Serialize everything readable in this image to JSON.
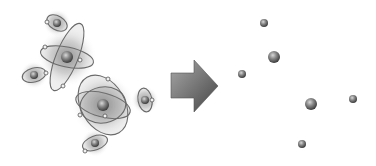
{
  "diagram": {
    "left_panel": {
      "label": "atoms-with-orbits",
      "atoms": [
        {
          "id": "top-small",
          "cx": 57,
          "cy": 23,
          "r": 4,
          "orbits": [
            {
              "rx": 11,
              "ry": 7,
              "rot": 30
            }
          ],
          "electrons": [
            [
              47,
              22
            ]
          ],
          "halo": 14
        },
        {
          "id": "upper-large",
          "cx": 67,
          "cy": 57,
          "r": 6,
          "orbits": [
            {
              "rx": 27,
              "ry": 10,
              "rot": 12
            },
            {
              "rx": 36,
              "ry": 11,
              "rot": -68
            }
          ],
          "electrons": [
            [
              45,
              47
            ],
            [
              80,
              60
            ],
            [
              63,
              86
            ]
          ],
          "halo": 30
        },
        {
          "id": "left-small",
          "cx": 34,
          "cy": 75,
          "r": 4,
          "orbits": [
            {
              "rx": 12,
              "ry": 7,
              "rot": -15
            }
          ],
          "electrons": [
            [
              46,
              73
            ]
          ],
          "halo": 14
        },
        {
          "id": "lower-large",
          "cx": 103,
          "cy": 105,
          "r": 6,
          "orbits": [
            {
              "rx": 28,
              "ry": 12,
              "rot": 15
            },
            {
              "rx": 32,
              "ry": 22,
              "rot": 60
            },
            {
              "rx": 23,
              "ry": 18,
              "rot": -10
            }
          ],
          "electrons": [
            [
              108,
              79
            ],
            [
              80,
              115
            ],
            [
              105,
              116
            ]
          ],
          "halo": 32
        },
        {
          "id": "right-small",
          "cx": 145,
          "cy": 100,
          "r": 4,
          "orbits": [
            {
              "rx": 7,
              "ry": 12,
              "rot": -10
            }
          ],
          "electrons": [
            [
              152,
              100
            ]
          ],
          "halo": 14
        },
        {
          "id": "bottom-small",
          "cx": 95,
          "cy": 143,
          "r": 4,
          "orbits": [
            {
              "rx": 13,
              "ry": 7,
              "rot": -20
            }
          ],
          "electrons": [
            [
              85,
              151
            ]
          ],
          "halo": 14
        }
      ]
    },
    "arrow": {
      "direction": "right",
      "points": "171,73 194,73 194,60 218,86 194,112 194,98 171,98",
      "color_light": "#9a9a9a",
      "color_dark": "#4a4a4a"
    },
    "right_panel": {
      "label": "bare-nuclei",
      "nuclei": [
        {
          "cx": 264,
          "cy": 23,
          "r": 4
        },
        {
          "cx": 274,
          "cy": 57,
          "r": 6
        },
        {
          "cx": 242,
          "cy": 74,
          "r": 4
        },
        {
          "cx": 311,
          "cy": 104,
          "r": 6
        },
        {
          "cx": 353,
          "cy": 99,
          "r": 4
        },
        {
          "cx": 302,
          "cy": 144,
          "r": 4
        }
      ]
    },
    "colors": {
      "background": "#ffffff",
      "orbit": "#6a6a6a",
      "electron_fill": "#f2f2f2",
      "sphere_light": "#b8b8b8",
      "sphere_dark": "#3c3c3c",
      "halo": "#7a7a7a"
    }
  }
}
